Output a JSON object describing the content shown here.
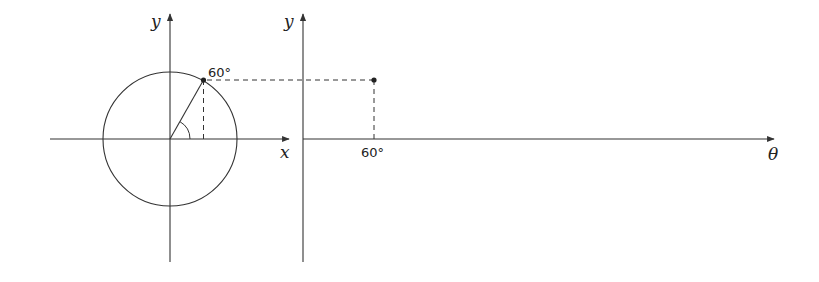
{
  "diagram": {
    "colors": {
      "stroke": "#333333",
      "background": "#ffffff"
    },
    "left_panel": {
      "x_axis_label": "x",
      "y_axis_label": "y",
      "point_label": "60°",
      "angle_degrees": 60,
      "shapes": [
        "circle",
        "radius-line",
        "angle-arc",
        "vertical-dashed-drop",
        "horizontal-dashed-projection"
      ]
    },
    "right_panel": {
      "x_axis_label": "θ",
      "y_axis_label": "y",
      "tick_label": "60°",
      "point": {
        "theta": "60°",
        "value": "sin 60°"
      }
    }
  }
}
